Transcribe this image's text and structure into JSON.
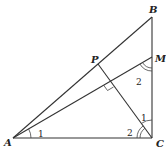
{
  "diagram": {
    "type": "geometry",
    "points": {
      "A": {
        "label": "A",
        "x": 13,
        "y": 138
      },
      "B": {
        "label": "B",
        "x": 152,
        "y": 17
      },
      "C": {
        "label": "C",
        "x": 152,
        "y": 138
      },
      "M": {
        "label": "M",
        "x": 152,
        "y": 57
      },
      "P": {
        "label": "P",
        "x": 98,
        "y": 64
      }
    },
    "segments": [
      "AB",
      "BC",
      "AC",
      "AM",
      "CP"
    ],
    "right_angle_at": "intersection of CP and AM",
    "angle_labels": {
      "angle_A": "1",
      "angle_C_lower": "2",
      "angle_C_upper": "1",
      "angle_M": "2"
    },
    "colors": {
      "line": "#333333",
      "text": "#222222",
      "background": "#ffffff"
    }
  }
}
